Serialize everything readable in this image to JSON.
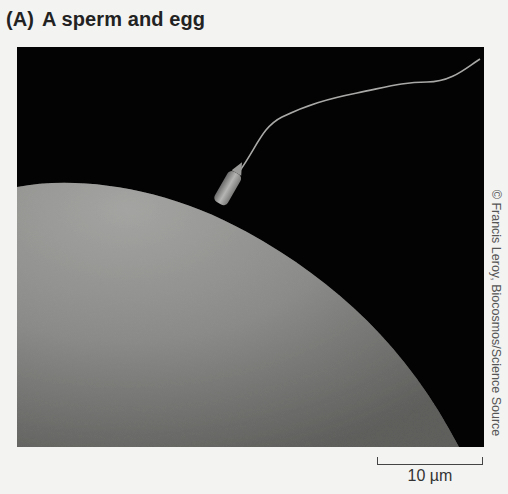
{
  "figure": {
    "panel_label": "(A)",
    "title": "A sperm and egg",
    "photo_description": "Scanning electron micrograph of a sperm attaching to the surface of an egg",
    "credit": "© Francis Leroy, Biocosmos/Science Source",
    "scale_bar": {
      "label": "10 µm"
    },
    "colors": {
      "background": "#f3f3f2",
      "photo_background": "#030303",
      "egg_surface": "#8a8a88",
      "text": "#222222"
    }
  }
}
